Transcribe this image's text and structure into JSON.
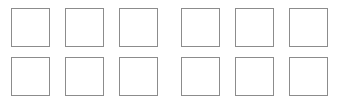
{
  "panel": {
    "name": "square-grid",
    "background_color": "#ffffff",
    "width": 349,
    "height": 103,
    "rows": 2,
    "columns": 6,
    "total_cells": 12
  },
  "cell_style": {
    "border_color": "#8c8c8c",
    "border_width": 1,
    "fill_color": "#ffffff",
    "size": 39,
    "shape": "square"
  },
  "grid": {
    "rows": [
      {
        "row_index": 0,
        "top": 8,
        "cells": [
          {
            "label": "",
            "index": 0,
            "left": 11,
            "state": "empty"
          },
          {
            "label": "",
            "index": 1,
            "left": 65,
            "state": "empty"
          },
          {
            "label": "",
            "index": 2,
            "left": 119,
            "state": "empty"
          },
          {
            "label": "",
            "index": 3,
            "left": 181,
            "state": "empty"
          },
          {
            "label": "",
            "index": 4,
            "left": 235,
            "state": "empty"
          },
          {
            "label": "",
            "index": 5,
            "left": 289,
            "state": "empty"
          }
        ]
      },
      {
        "row_index": 1,
        "top": 57,
        "cells": [
          {
            "label": "",
            "index": 6,
            "left": 11,
            "state": "empty"
          },
          {
            "label": "",
            "index": 7,
            "left": 65,
            "state": "empty"
          },
          {
            "label": "",
            "index": 8,
            "left": 119,
            "state": "empty"
          },
          {
            "label": "",
            "index": 9,
            "left": 181,
            "state": "empty"
          },
          {
            "label": "",
            "index": 10,
            "left": 235,
            "state": "empty"
          },
          {
            "label": "",
            "index": 11,
            "left": 289,
            "state": "empty"
          }
        ]
      }
    ]
  }
}
